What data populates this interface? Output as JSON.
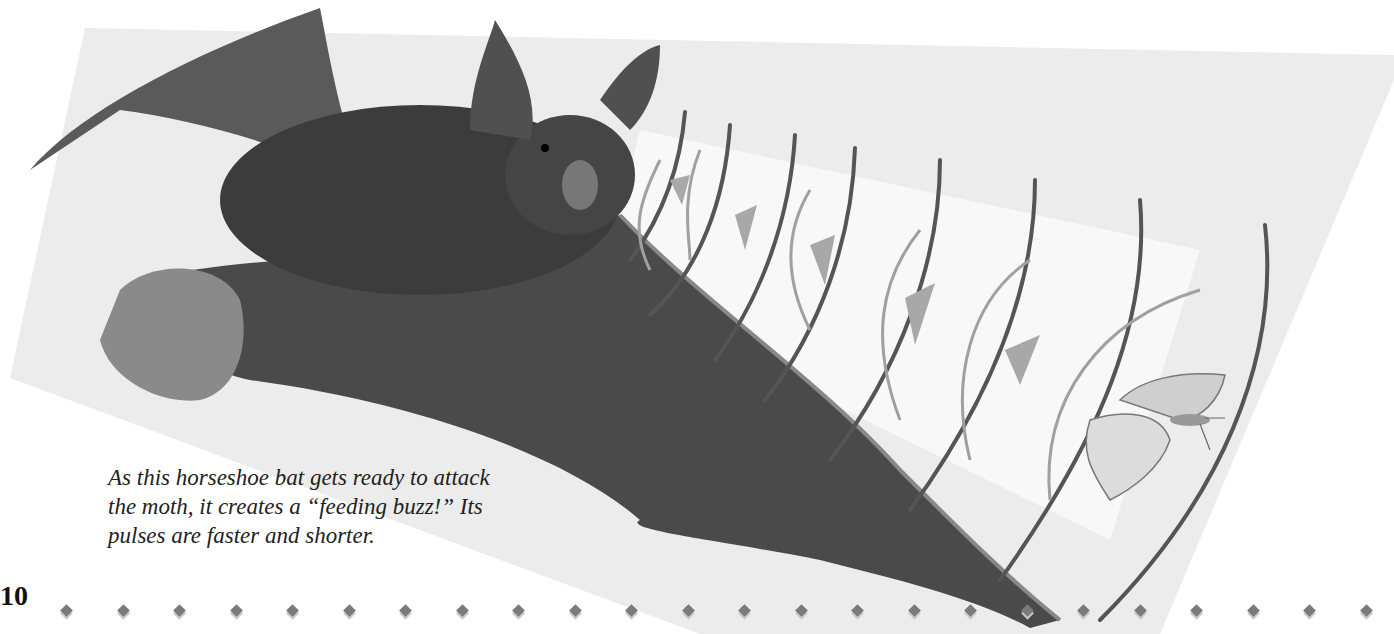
{
  "page": {
    "number": "10",
    "caption_lines": [
      "As this horseshoe bat gets ready to attack",
      "the moth, it creates a “feeding buzz!” Its",
      "pulses are faster and shorter."
    ],
    "illustration": {
      "subject": "horseshoe bat emitting echolocation pulses toward a moth",
      "elements": [
        "bat",
        "sound-wave-arcs",
        "echo-triangles",
        "moth"
      ]
    },
    "colors": {
      "panel": "#ececec",
      "beam": "#f7f7f7",
      "wave": "#555555",
      "echo": "#9a9a9a",
      "bat": "#3a3a3a"
    },
    "diamond_count": 24
  }
}
